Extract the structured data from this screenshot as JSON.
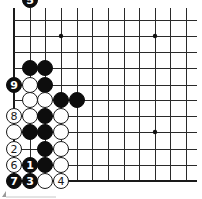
{
  "diagram": {
    "type": "go-board-fragment",
    "colors": {
      "black": "#0d0d0d",
      "white": "#ffffff",
      "line": "#2a2a2a",
      "background": "#ffffff"
    },
    "grid": {
      "x_lines": [
        14,
        30,
        45,
        61,
        77,
        92,
        108,
        124,
        139,
        155,
        170,
        186
      ],
      "y_lines": [
        20,
        36,
        52,
        68,
        85,
        100,
        116,
        132,
        149,
        165,
        181
      ],
      "top_extent": 8,
      "right_extent": 197,
      "left_edge_is_board_edge": true,
      "bottom_edge_is_board_edge": true
    },
    "hoshi": [
      {
        "col": 3,
        "row": 1
      },
      {
        "col": 9,
        "row": 1
      },
      {
        "col": 9,
        "row": 7
      }
    ],
    "stones": [
      {
        "col": 1,
        "row": 3,
        "color": "black",
        "label": ""
      },
      {
        "col": 2,
        "row": 3,
        "color": "black",
        "label": ""
      },
      {
        "col": 0,
        "row": 4,
        "color": "black",
        "label": "9"
      },
      {
        "col": 1,
        "row": 4,
        "color": "white",
        "label": ""
      },
      {
        "col": 2,
        "row": 4,
        "color": "black",
        "label": ""
      },
      {
        "col": 1,
        "row": 5,
        "color": "white",
        "label": ""
      },
      {
        "col": 2,
        "row": 5,
        "color": "white",
        "label": ""
      },
      {
        "col": 3,
        "row": 5,
        "color": "black",
        "label": ""
      },
      {
        "col": 4,
        "row": 5,
        "color": "black",
        "label": ""
      },
      {
        "col": 0,
        "row": 6,
        "color": "white",
        "label": "8"
      },
      {
        "col": 1,
        "row": 6,
        "color": "white",
        "label": ""
      },
      {
        "col": 2,
        "row": 6,
        "color": "black",
        "label": ""
      },
      {
        "col": 3,
        "row": 6,
        "color": "white",
        "label": ""
      },
      {
        "col": 0,
        "row": 7,
        "color": "white",
        "label": ""
      },
      {
        "col": 1,
        "row": 7,
        "color": "black",
        "label": ""
      },
      {
        "col": 2,
        "row": 7,
        "color": "black",
        "label": ""
      },
      {
        "col": 3,
        "row": 7,
        "color": "white",
        "label": ""
      },
      {
        "col": 0,
        "row": 8,
        "color": "white",
        "label": "2"
      },
      {
        "col": 2,
        "row": 8,
        "color": "black",
        "label": ""
      },
      {
        "col": 3,
        "row": 8,
        "color": "white",
        "label": ""
      },
      {
        "col": 0,
        "row": 9,
        "color": "white",
        "label": "6"
      },
      {
        "col": 1,
        "row": 9,
        "color": "black",
        "label": "1"
      },
      {
        "col": 2,
        "row": 9,
        "color": "black",
        "label": ""
      },
      {
        "col": 3,
        "row": 9,
        "color": "white",
        "label": ""
      },
      {
        "col": 0,
        "row": 10,
        "color": "black",
        "label": "7"
      },
      {
        "col": 1,
        "row": 10,
        "color": "black",
        "label": "3"
      },
      {
        "col": 2,
        "row": 10,
        "color": "white",
        "label": ""
      },
      {
        "col": 3,
        "row": 10,
        "color": "white",
        "label": "4"
      },
      {
        "col": 1,
        "row": 11,
        "color": "black",
        "label": "5"
      }
    ],
    "stone_radius": 7.5
  }
}
